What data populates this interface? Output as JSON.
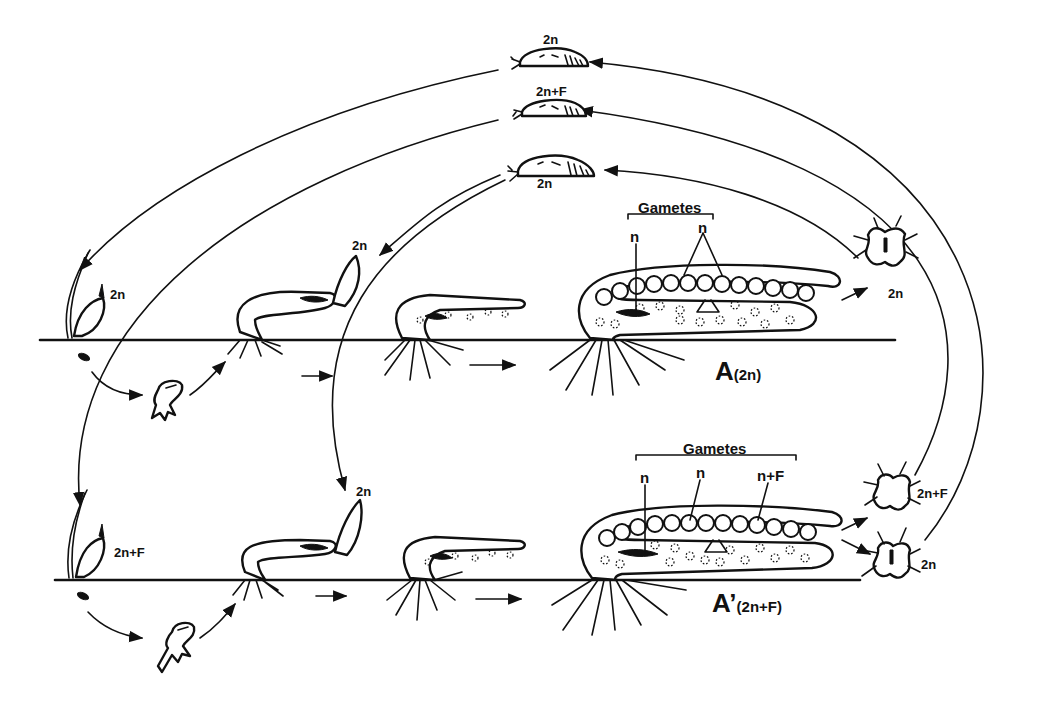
{
  "figure": {
    "type": "life-cycle diagram",
    "rows": [
      {
        "id": "A",
        "label_letter": "A",
        "label_ploidy": "(2n)",
        "gametes_title": "Gametes",
        "gamete_labels": [
          "n",
          "n"
        ],
        "larva_label": "2n",
        "settling_stage_label": "2n",
        "seed_stage_label": "2n"
      },
      {
        "id": "A'",
        "label_letter": "A’",
        "label_ploidy": "(2n+F)",
        "gametes_title": "Gametes",
        "gamete_labels": [
          "n",
          "n",
          "n+F"
        ],
        "larva_labels": [
          "2n+F",
          "2n"
        ],
        "settling_stage_label": "2n",
        "seed_stage_label": "2n+F"
      }
    ],
    "free_swimming_stages": [
      {
        "label": "2n"
      },
      {
        "label": "2n+F"
      },
      {
        "label": "2n"
      }
    ],
    "flow_arrows": "right-pointing arrows between developmental stages; curved arrows link larvae back to settling stages",
    "colors": {
      "ink": "#111111",
      "background": "#ffffff"
    }
  }
}
